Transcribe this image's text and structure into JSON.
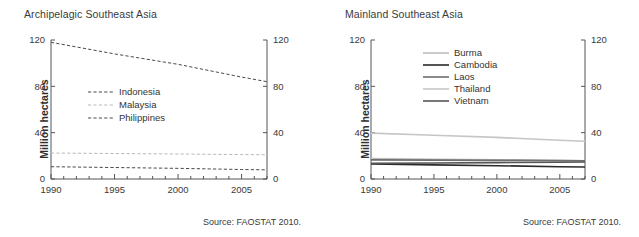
{
  "figure": {
    "source_note": "Source: FAOSTAT 2010.",
    "y_axis_label": "Million hectares"
  },
  "panels": [
    {
      "id": "archipelagic",
      "title": "Archipelagic Southeast Asia",
      "source_note": "Source: FAOSTAT 2010.",
      "y_axis_label": "Million hectares",
      "chart_data": {
        "type": "line",
        "title": "Archipelagic Southeast Asia",
        "xlabel": "",
        "ylabel": "Million hectares",
        "xlim": [
          1990,
          2007
        ],
        "ylim": [
          0,
          120
        ],
        "yticks": [
          0,
          40,
          80,
          120
        ],
        "xticks": [
          1990,
          1995,
          2000,
          2005
        ],
        "xminor_step": 1,
        "grid": false,
        "legend_position": "center-left-inside",
        "dual_y_axis": true,
        "x": [
          1990,
          1995,
          2000,
          2005,
          2007
        ],
        "series": [
          {
            "name": "Indonesia",
            "color": "#4a4a4a",
            "style": "dashed",
            "width": 1,
            "values": [
              118,
              108,
              99,
              88,
              84
            ]
          },
          {
            "name": "Malaysia",
            "color": "#b9b9b9",
            "style": "dashed",
            "width": 1,
            "values": [
              22.4,
              22.0,
              21.6,
              21.1,
              20.9
            ]
          },
          {
            "name": "Philippines",
            "color": "#4a4a4a",
            "style": "dashed",
            "width": 1,
            "values": [
              10.6,
              9.9,
              9.2,
              8.2,
              7.9
            ]
          }
        ]
      }
    },
    {
      "id": "mainland",
      "title": "Mainland Southeast Asia",
      "source_note": "Source: FAOSTAT 2010.",
      "y_axis_label": "Million hectares",
      "chart_data": {
        "type": "line",
        "title": "Mainland Southeast Asia",
        "xlabel": "",
        "ylabel": "Million hectares",
        "xlim": [
          1990,
          2007
        ],
        "ylim": [
          0,
          120
        ],
        "yticks": [
          0,
          40,
          80,
          120
        ],
        "xticks": [
          1990,
          1995,
          2000,
          2005
        ],
        "xminor_step": 1,
        "grid": false,
        "legend_position": "upper-center-inside",
        "dual_y_axis": true,
        "x": [
          1990,
          1995,
          2000,
          2005,
          2007
        ],
        "series": [
          {
            "name": "Burma",
            "color": "#bdbdbd",
            "style": "solid",
            "width": 1.6,
            "values": [
              17.6,
              17.1,
              16.6,
              16.0,
              15.8
            ]
          },
          {
            "name": "Cambodia",
            "color": "#2a2a2a",
            "style": "solid",
            "width": 1.6,
            "values": [
              12.9,
              12.2,
              11.5,
              10.6,
              10.3
            ]
          },
          {
            "name": "Laos",
            "color": "#6e6e6e",
            "style": "solid",
            "width": 1.6,
            "values": [
              16.5,
              16.3,
              16.1,
              15.9,
              15.8
            ]
          },
          {
            "name": "Thailand",
            "color": "#c6c6c6",
            "style": "solid",
            "width": 1.6,
            "values": [
              39.6,
              37.8,
              35.9,
              33.5,
              32.6
            ]
          },
          {
            "name": "Vietnam",
            "color": "#555555",
            "style": "solid",
            "width": 1.6,
            "values": [
              13.5,
              13.8,
              14.1,
              14.5,
              14.7
            ]
          }
        ]
      }
    }
  ]
}
